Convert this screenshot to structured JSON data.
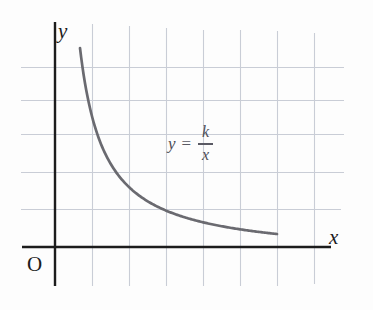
{
  "figure": {
    "background_color": "#fdfdfd",
    "axis_color": "#1c1c1c",
    "grid_color": "#c9cdd6",
    "curve_color": "#6a6a70",
    "equation_color": "#4c4c56"
  },
  "labels": {
    "x_axis": "x",
    "y_axis": "y",
    "origin": "O"
  },
  "equation": {
    "lhs": "y",
    "operator": "=",
    "numerator": "k",
    "denominator": "x",
    "full_text": "y = k/x"
  },
  "chart_data": {
    "type": "line",
    "title": "",
    "subtitle": "",
    "xlabel": "x",
    "ylabel": "y",
    "legend": [],
    "legend_position": "none",
    "grid": true,
    "annotations": [
      {
        "text": "y = k/x",
        "x": 2.9,
        "y": 3.15
      },
      {
        "text": "O",
        "x": -0.35,
        "y": -0.35
      }
    ],
    "axis_origin_label": "O",
    "xlim": [
      -0.9,
      7.6
    ],
    "ylim": [
      -1.1,
      6.2
    ],
    "x_gridlines": [
      1,
      2,
      3,
      4,
      5,
      6,
      7,
      8
    ],
    "y_gridlines": [
      1,
      2,
      3,
      4,
      5
    ],
    "series": [
      {
        "name": "y = k/x",
        "function": "y = k / x",
        "k": 3.2,
        "x_range": [
          0.67,
          6.0
        ],
        "x": [
          0.67,
          0.8,
          1.0,
          1.2,
          1.4,
          1.6,
          1.8,
          2.0,
          2.3,
          2.6,
          3.0,
          3.4,
          3.8,
          4.2,
          4.6,
          5.0,
          5.5,
          6.0
        ],
        "y": [
          4.78,
          4.0,
          3.2,
          2.67,
          2.29,
          2.0,
          1.78,
          1.6,
          1.39,
          1.23,
          1.07,
          0.94,
          0.84,
          0.76,
          0.7,
          0.64,
          0.58,
          0.53
        ]
      }
    ]
  },
  "geometry": {
    "grid_x_positions": [
      55,
      92,
      129,
      166,
      203,
      240,
      277,
      314
    ],
    "grid_y_positions": [
      67,
      100,
      134,
      172,
      209
    ],
    "grid_x_span": [
      31,
      286
    ],
    "grid_y_span": [
      21,
      345
    ],
    "x_axis_y": 247,
    "x_axis_span": [
      22,
      331
    ],
    "y_axis_x": 55,
    "y_axis_span": [
      22,
      286
    ],
    "curve_start": [
      80,
      48
    ],
    "curve_end": [
      277,
      234
    ]
  }
}
